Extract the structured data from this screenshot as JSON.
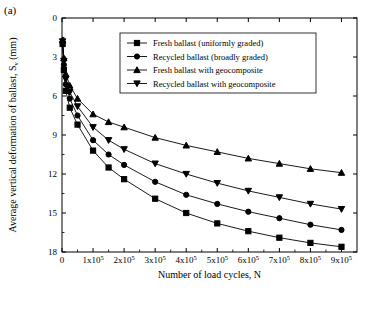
{
  "panel": {
    "label": "(a)"
  },
  "chart_data": {
    "type": "line",
    "title": "",
    "xlabel": "Number of load cycles, N",
    "ylabel": "Average vertical deformation of ballast, S",
    "ylabel_sub": "v",
    "ylabel_unit": " (mm)",
    "xlim": [
      0,
      950000
    ],
    "ylim": [
      18,
      0
    ],
    "grid": false,
    "legend_position": "top-right",
    "x_ticks": [
      {
        "value": 0,
        "label": "0"
      },
      {
        "value": 100000,
        "label": "1x10",
        "exp": "5"
      },
      {
        "value": 200000,
        "label": "2x10",
        "exp": "5"
      },
      {
        "value": 300000,
        "label": "3x10",
        "exp": "5"
      },
      {
        "value": 400000,
        "label": "4x10",
        "exp": "5"
      },
      {
        "value": 500000,
        "label": "5x10",
        "exp": "5"
      },
      {
        "value": 600000,
        "label": "6x10",
        "exp": "5"
      },
      {
        "value": 700000,
        "label": "7x10",
        "exp": "5"
      },
      {
        "value": 800000,
        "label": "8x10",
        "exp": "5"
      },
      {
        "value": 900000,
        "label": "9x10",
        "exp": "5"
      }
    ],
    "y_ticks": [
      {
        "value": 0,
        "label": "0"
      },
      {
        "value": 3,
        "label": "3"
      },
      {
        "value": 6,
        "label": "6"
      },
      {
        "value": 9,
        "label": "9"
      },
      {
        "value": 12,
        "label": "12"
      },
      {
        "value": 15,
        "label": "15"
      },
      {
        "value": 18,
        "label": "18"
      }
    ],
    "series": [
      {
        "name": "Fresh ballast (uniformly graded)",
        "marker": "square",
        "points": [
          [
            2000,
            2.0
          ],
          [
            6000,
            4.0
          ],
          [
            12000,
            5.6
          ],
          [
            25000,
            6.9
          ],
          [
            50000,
            8.2
          ],
          [
            100000,
            10.2
          ],
          [
            150000,
            11.5
          ],
          [
            200000,
            12.4
          ],
          [
            300000,
            13.9
          ],
          [
            400000,
            15.0
          ],
          [
            500000,
            15.8
          ],
          [
            600000,
            16.4
          ],
          [
            700000,
            16.9
          ],
          [
            800000,
            17.3
          ],
          [
            900000,
            17.6
          ]
        ]
      },
      {
        "name": "Recycled ballast (broadly graded)",
        "marker": "circle",
        "points": [
          [
            2000,
            1.9
          ],
          [
            6000,
            3.6
          ],
          [
            12000,
            5.1
          ],
          [
            25000,
            6.2
          ],
          [
            50000,
            7.5
          ],
          [
            100000,
            9.4
          ],
          [
            150000,
            10.5
          ],
          [
            200000,
            11.3
          ],
          [
            300000,
            12.6
          ],
          [
            400000,
            13.6
          ],
          [
            500000,
            14.3
          ],
          [
            600000,
            14.9
          ],
          [
            700000,
            15.4
          ],
          [
            800000,
            15.9
          ],
          [
            900000,
            16.3
          ]
        ]
      },
      {
        "name": "Fresh ballast with geocomposite",
        "marker": "triangle-up",
        "points": [
          [
            2000,
            1.7
          ],
          [
            6000,
            3.1
          ],
          [
            12000,
            4.3
          ],
          [
            25000,
            5.2
          ],
          [
            50000,
            6.2
          ],
          [
            100000,
            7.4
          ],
          [
            150000,
            8.0
          ],
          [
            200000,
            8.4
          ],
          [
            300000,
            9.2
          ],
          [
            400000,
            9.8
          ],
          [
            500000,
            10.3
          ],
          [
            600000,
            10.8
          ],
          [
            700000,
            11.2
          ],
          [
            800000,
            11.6
          ],
          [
            900000,
            11.9
          ]
        ]
      },
      {
        "name": "Recycled ballast with geocomposite",
        "marker": "triangle-down",
        "points": [
          [
            2000,
            1.8
          ],
          [
            6000,
            3.3
          ],
          [
            12000,
            4.7
          ],
          [
            25000,
            5.7
          ],
          [
            50000,
            6.8
          ],
          [
            100000,
            8.4
          ],
          [
            150000,
            9.4
          ],
          [
            200000,
            10.1
          ],
          [
            300000,
            11.2
          ],
          [
            400000,
            12.0
          ],
          [
            500000,
            12.7
          ],
          [
            600000,
            13.3
          ],
          [
            700000,
            13.8
          ],
          [
            800000,
            14.3
          ],
          [
            900000,
            14.7
          ]
        ]
      }
    ]
  }
}
